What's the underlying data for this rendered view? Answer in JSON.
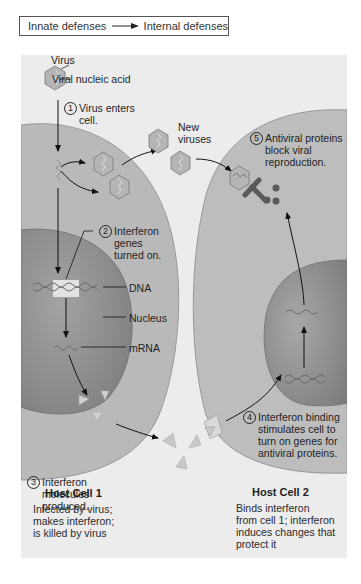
{
  "header": {
    "from_label": "Innate defenses",
    "to_label": "Internal defenses",
    "arrow_icon": "right-arrow-icon"
  },
  "legend": {
    "virus": "Virus",
    "viral_nucleic_acid": "Viral nucleic acid"
  },
  "steps": [
    {
      "number": "1",
      "text": "Virus enters\ncell."
    },
    {
      "number": "2",
      "text": "Interferon\ngenes\nturned on."
    },
    {
      "number": "3",
      "text": "Interferon\nmolecules\nproduced."
    },
    {
      "number": "4",
      "text": "Interferon binding\nstimulates cell to\nturn on genes for\nantiviral proteins."
    },
    {
      "number": "5",
      "text": "Antiviral proteins\nblock viral\nreproduction."
    }
  ],
  "labels": {
    "new_viruses": "New\nviruses",
    "dna": "DNA",
    "nucleus": "Nucleus",
    "mrna": "mRNA"
  },
  "cells": [
    {
      "title": "Host Cell 1",
      "description": "Infected by virus;\nmakes interferon;\nis killed by virus"
    },
    {
      "title": "Host Cell 2",
      "description": "Binds interferon\nfrom cell 1; interferon\ninduces changes that\nprotect it"
    }
  ],
  "colors": {
    "panel_bg": "#ececec",
    "cytoplasm": "#b9b9b9",
    "nucleus": "#8f8f8f",
    "virus_fill": "#b5b5b5",
    "interferon": "#c9c9c9",
    "antiviral_protein": "#5a5a5a"
  }
}
